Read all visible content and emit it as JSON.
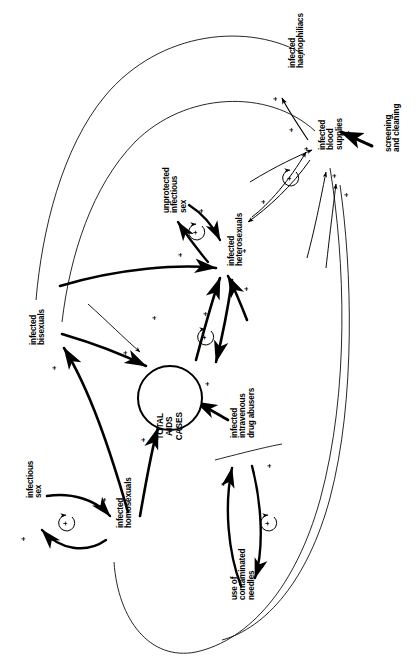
{
  "diagram": {
    "type": "causal-loop-diagram",
    "orientation": "labels rotated 90 degrees counter-clockwise",
    "background_color": "#ffffff",
    "line_color": "#000000",
    "width": 417,
    "height": 664
  },
  "nodes": [
    {
      "id": "total_aids_cases",
      "label": "TOTAL\nAIDS\nCASES",
      "shape": "circle",
      "x": 170,
      "y": 398
    },
    {
      "id": "infected_haemophiliacs",
      "label": "infected\nhaemophiliacs",
      "shape": "text",
      "x": 289,
      "y": 68
    },
    {
      "id": "infected_blood_supplies",
      "label": "infected\nblood\nsupplies",
      "shape": "text",
      "x": 319,
      "y": 150
    },
    {
      "id": "screening_and_cleaning",
      "label": "screening\nand cleaning",
      "shape": "text",
      "x": 385,
      "y": 152
    },
    {
      "id": "unprotected_infectious_sex",
      "label": "unprotected\ninfectious\nsex",
      "shape": "text",
      "x": 163,
      "y": 213
    },
    {
      "id": "infected_heterosexuals",
      "label": "infected\nheterosexuals",
      "shape": "text",
      "x": 228,
      "y": 266
    },
    {
      "id": "infected_bisexuals",
      "label": "infected\nbisexuals",
      "shape": "text",
      "x": 30,
      "y": 345
    },
    {
      "id": "infectious_sex",
      "label": "infectious\nsex",
      "shape": "text",
      "x": 27,
      "y": 498
    },
    {
      "id": "infected_homosexuals",
      "label": "infected\nhomosexuals",
      "shape": "text",
      "x": 117,
      "y": 528
    },
    {
      "id": "infected_iv_drug_abusers",
      "label": "infected\nintravenous\ndrug abusers",
      "shape": "text",
      "x": 231,
      "y": 438
    },
    {
      "id": "use_of_contaminated_needles",
      "label": "use of\ncontaminated\nneedles",
      "shape": "text",
      "x": 231,
      "y": 600
    }
  ],
  "links": [
    {
      "from": "infected_blood_supplies",
      "to": "infected_haemophiliacs",
      "sign": "+",
      "weight": "thin"
    },
    {
      "from": "screening_and_cleaning",
      "to": "infected_blood_supplies",
      "sign": "-",
      "weight": "bold"
    },
    {
      "from": "infected_heterosexuals",
      "to": "infected_blood_supplies",
      "sign": "+",
      "weight": "thin"
    },
    {
      "from": "infected_blood_supplies",
      "to": "infected_heterosexuals",
      "sign": "+",
      "weight": "thin"
    },
    {
      "from": "infected_homosexuals",
      "to": "infected_blood_supplies",
      "sign": "+",
      "weight": "thin"
    },
    {
      "from": "infected_iv_drug_abusers",
      "to": "infected_blood_supplies",
      "sign": "+",
      "weight": "thin"
    },
    {
      "from": "infected_bisexuals",
      "to": "infected_blood_supplies",
      "sign": "+",
      "weight": "thin"
    },
    {
      "from": "unprotected_infectious_sex",
      "to": "infected_heterosexuals",
      "sign": "+",
      "weight": "bold"
    },
    {
      "from": "infected_heterosexuals",
      "to": "unprotected_infectious_sex",
      "sign": "+",
      "weight": "bold"
    },
    {
      "from": "infected_bisexuals",
      "to": "infected_heterosexuals",
      "sign": "+",
      "weight": "bold"
    },
    {
      "from": "infected_iv_drug_abusers",
      "to": "infected_heterosexuals",
      "sign": "+",
      "weight": "bold"
    },
    {
      "from": "infected_heterosexuals",
      "to": "total_aids_cases",
      "sign": "+",
      "weight": "bold"
    },
    {
      "from": "infected_bisexuals",
      "to": "total_aids_cases",
      "sign": "+",
      "weight": "bold"
    },
    {
      "from": "infected_homosexuals",
      "to": "total_aids_cases",
      "sign": "+",
      "weight": "bold"
    },
    {
      "from": "infected_iv_drug_abusers",
      "to": "total_aids_cases",
      "sign": "+",
      "weight": "bold"
    },
    {
      "from": "infected_haemophiliacs",
      "to": "total_aids_cases",
      "sign": "+",
      "weight": "thin"
    },
    {
      "from": "infected_homosexuals",
      "to": "infected_bisexuals",
      "sign": "+",
      "weight": "bold"
    },
    {
      "from": "infectious_sex",
      "to": "infected_homosexuals",
      "sign": "+",
      "weight": "bold"
    },
    {
      "from": "infected_homosexuals",
      "to": "infectious_sex",
      "sign": "+",
      "weight": "bold"
    },
    {
      "from": "use_of_contaminated_needles",
      "to": "infected_iv_drug_abusers",
      "sign": "+",
      "weight": "bold"
    },
    {
      "from": "infected_iv_drug_abusers",
      "to": "use_of_contaminated_needles",
      "sign": "+",
      "weight": "bold"
    }
  ],
  "loops": [
    {
      "id": "loop_heterosexual_sex",
      "polarity": "+",
      "x": 196,
      "y": 232
    },
    {
      "id": "loop_blood_heterosexual",
      "polarity": "+",
      "x": 290,
      "y": 178
    },
    {
      "id": "loop_aids_heterosexual",
      "polarity": "+",
      "x": 205,
      "y": 337
    },
    {
      "id": "loop_homosexual_sex",
      "polarity": "+",
      "x": 66,
      "y": 523
    },
    {
      "id": "loop_needles",
      "polarity": "+",
      "x": 268,
      "y": 523
    }
  ],
  "signs": {
    "haemophiliacs_in": {
      "text": "+",
      "x": 274,
      "y": 95
    },
    "blood_from_hetero": {
      "text": "+",
      "x": 290,
      "y": 126
    },
    "blood_from_bisexual": {
      "text": "+",
      "x": 305,
      "y": 145
    },
    "screening_minus": {
      "text": "-",
      "x": 347,
      "y": 128
    },
    "blood_in_lower_a": {
      "text": "+",
      "x": 333,
      "y": 172
    },
    "blood_in_lower_b": {
      "text": "+",
      "x": 345,
      "y": 191
    },
    "hetero_from_loop": {
      "text": "+",
      "x": 262,
      "y": 198
    },
    "hetero_sex_plus": {
      "text": "+",
      "x": 200,
      "y": 207
    },
    "sex_to_hetero_plus": {
      "text": "+",
      "x": 179,
      "y": 251
    },
    "hetero_in_bisexual": {
      "text": "+",
      "x": 243,
      "y": 247
    },
    "hetero_in_drug": {
      "text": "+",
      "x": 245,
      "y": 285
    },
    "hetero_to_aids": {
      "text": "+",
      "x": 204,
      "y": 310
    },
    "bisexual_to_aids": {
      "text": "+",
      "x": 153,
      "y": 314
    },
    "bisexual_in": {
      "text": "+",
      "x": 53,
      "y": 364
    },
    "aids_from_bisexual": {
      "text": "+",
      "x": 124,
      "y": 349
    },
    "aids_from_drug": {
      "text": "+",
      "x": 206,
      "y": 380
    },
    "aids_from_homosexual": {
      "text": "+",
      "x": 142,
      "y": 436
    },
    "infectious_sex_plus": {
      "text": "+",
      "x": 22,
      "y": 535
    },
    "homo_to_sex_plus": {
      "text": "+",
      "x": 103,
      "y": 496
    },
    "drug_in_plus": {
      "text": "+",
      "x": 222,
      "y": 480
    },
    "drug_needles_plus": {
      "text": "+",
      "x": 268,
      "y": 462
    },
    "needles_to_drug_plus": {
      "text": "+",
      "x": 261,
      "y": 562
    }
  }
}
